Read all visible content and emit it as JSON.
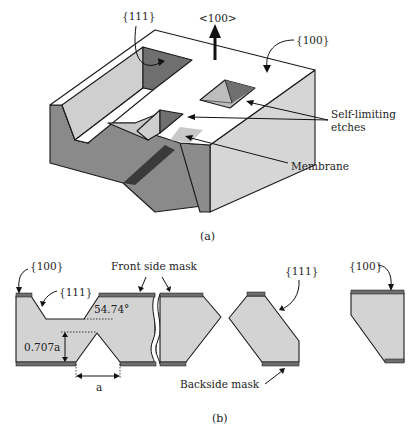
{
  "figure_a": {
    "caption": "(a)",
    "labels": {
      "plane_111": "{111}",
      "direction_100": "<100>",
      "plane_100": "{100}",
      "self_limiting_line1": "Self-limiting",
      "self_limiting_line2": "etches",
      "membrane": "Membrane"
    }
  },
  "figure_b": {
    "caption": "(b)",
    "labels": {
      "plane_100_left": "{100}",
      "plane_111_left": "{111}",
      "front_side_mask": "Front side mask",
      "angle": "54.74°",
      "depth": "0.707a",
      "width": "a",
      "plane_111_right": "{111}",
      "backside_mask": "Backside mask",
      "plane_100_right": "{100}"
    }
  },
  "colors": {
    "top_face": "#ffffff",
    "light_face": "#d9d9d9",
    "mid_face": "#a8a8a8",
    "dark_face": "#7a7a7a",
    "mask": "#6e6e6e",
    "section_fill": "#d3d3d3"
  }
}
